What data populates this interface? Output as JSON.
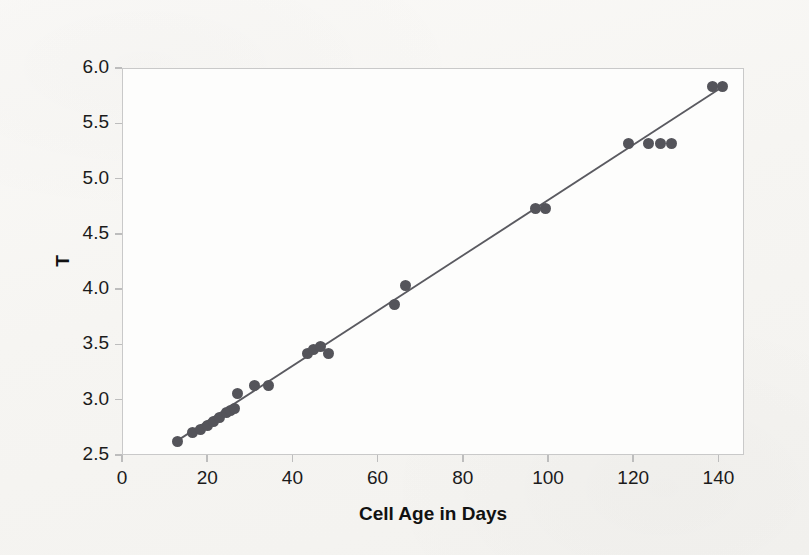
{
  "figure": {
    "background_color": "#f8f7f5",
    "plot_background_color": "#fdfdfc",
    "frame_color": "#c9c9c9"
  },
  "chart_data": {
    "type": "scatter",
    "title": "",
    "subtitle": "",
    "xlabel": "Cell Age in Days",
    "ylabel": "T",
    "xlim": [
      0,
      146
    ],
    "ylim": [
      2.5,
      6.0
    ],
    "xticks": [
      0,
      20,
      40,
      60,
      80,
      100,
      120,
      140
    ],
    "xtick_labels": [
      "0",
      "20",
      "40",
      "60",
      "80",
      "100",
      "120",
      "140"
    ],
    "yticks": [
      2.5,
      3.0,
      3.5,
      4.0,
      4.5,
      5.0,
      5.5,
      6.0
    ],
    "ytick_labels": [
      "2.5",
      "3.0",
      "3.5",
      "4.0",
      "4.5",
      "5.0",
      "5.5",
      "6.0"
    ],
    "grid": false,
    "legend": null,
    "legend_position": "none",
    "marker_color": "#54545a",
    "marker_size": 11,
    "line_color": "#5a5a60",
    "series": [
      {
        "name": "Observed",
        "type": "scatter",
        "marker_color": "#54545a",
        "x": [
          13,
          16.5,
          18.5,
          20,
          21.5,
          23,
          24.5,
          25.5,
          26.5,
          27,
          31,
          34.5,
          43.5,
          45,
          46.5,
          48.5,
          64,
          66.5,
          97,
          99.5,
          119,
          123.5,
          126.5,
          129,
          138.5,
          141
        ],
        "y": [
          2.62,
          2.7,
          2.73,
          2.77,
          2.8,
          2.84,
          2.88,
          2.9,
          2.92,
          3.06,
          3.13,
          3.13,
          3.42,
          3.45,
          3.48,
          3.42,
          3.86,
          4.03,
          4.73,
          4.73,
          5.32,
          5.32,
          5.32,
          5.32,
          5.83,
          5.83
        ]
      },
      {
        "name": "Fitted line",
        "type": "line",
        "line_color": "#5a5a60",
        "x": [
          13,
          141
        ],
        "y": [
          2.63,
          5.83
        ]
      }
    ]
  }
}
